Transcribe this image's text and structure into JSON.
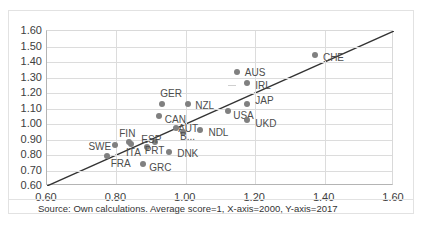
{
  "chart_data": {
    "type": "scatter",
    "title": "",
    "xlabel": "",
    "ylabel": "",
    "xlim": [
      0.6,
      1.6
    ],
    "ylim": [
      0.6,
      1.6
    ],
    "xticks": [
      "0.60",
      "0.80",
      "1.00",
      "1.20",
      "1.40",
      "1.60"
    ],
    "xtick_values": [
      0.6,
      0.8,
      1.0,
      1.2,
      1.4,
      1.6
    ],
    "yticks": [
      "0.60",
      "0.70",
      "0.80",
      "0.90",
      "1.00",
      "1.10",
      "1.20",
      "1.30",
      "1.40",
      "1.50",
      "1.60"
    ],
    "ytick_values": [
      0.6,
      0.7,
      0.8,
      0.9,
      1.0,
      1.1,
      1.2,
      1.3,
      1.4,
      1.5,
      1.6
    ],
    "grid": true,
    "legend": "none",
    "marker_color": "#808080",
    "trendline": {
      "type": "45-degree-reference",
      "x0": 0.6,
      "y0": 0.6,
      "x1": 1.6,
      "y1": 1.6,
      "color": "#333333"
    },
    "points": [
      {
        "label": "FRA",
        "x": 0.775,
        "y": 0.79,
        "label_dx": 4,
        "label_dy": 8
      },
      {
        "label": "SWE",
        "x": 0.8,
        "y": 0.855,
        "label_dx": -27,
        "label_dy": 2
      },
      {
        "label": "FIN",
        "x": 0.84,
        "y": 0.875,
        "label_dx": -10,
        "label_dy": -8
      },
      {
        "label": "ITA",
        "x": 0.845,
        "y": 0.865,
        "label_dx": -5,
        "label_dy": 9
      },
      {
        "label": "GRC",
        "x": 0.88,
        "y": 0.735,
        "label_dx": 6,
        "label_dy": 4
      },
      {
        "label": "PRT",
        "x": 0.89,
        "y": 0.845,
        "label_dx": -2,
        "label_dy": 4
      },
      {
        "label": "ESP",
        "x": 0.915,
        "y": 0.875,
        "label_dx": -14,
        "label_dy": -2
      },
      {
        "label": "CAN",
        "x": 0.925,
        "y": 1.045,
        "label_dx": 6,
        "label_dy": 4
      },
      {
        "label": "GER",
        "x": 0.935,
        "y": 1.125,
        "label_dx": -2,
        "label_dy": -10
      },
      {
        "label": "DNK",
        "x": 0.955,
        "y": 0.81,
        "label_dx": 8,
        "label_dy": 2
      },
      {
        "label": "AUT",
        "x": 0.975,
        "y": 0.97,
        "label_dx": 2,
        "label_dy": 1
      },
      {
        "label": "B...",
        "x": 0.995,
        "y": 0.94,
        "label_dx": -3,
        "label_dy": 5
      },
      {
        "label": "NZL",
        "x": 1.01,
        "y": 1.125,
        "label_dx": 7,
        "label_dy": 2
      },
      {
        "label": "NDL",
        "x": 1.045,
        "y": 0.955,
        "label_dx": 8,
        "label_dy": 3
      },
      {
        "label": "USA",
        "x": 1.125,
        "y": 1.08,
        "label_dx": 5,
        "label_dy": 5
      },
      {
        "label": "AUS",
        "x": 1.15,
        "y": 1.33,
        "label_dx": 8,
        "label_dy": 1
      },
      {
        "label": "JAP",
        "x": 1.18,
        "y": 1.125,
        "label_dx": 8,
        "label_dy": -3
      },
      {
        "label": "IRL",
        "x": 1.18,
        "y": 1.26,
        "label_dx": 8,
        "label_dy": 3
      },
      {
        "label": "UKD",
        "x": 1.18,
        "y": 1.02,
        "label_dx": 8,
        "label_dy": 4
      },
      {
        "label": "CHE",
        "x": 1.375,
        "y": 1.44,
        "label_dx": 8,
        "label_dy": 3
      }
    ]
  },
  "footer": {
    "note": "Source: Own calculations. Average score=1, X-axis=2000, Y-axis=2017"
  }
}
